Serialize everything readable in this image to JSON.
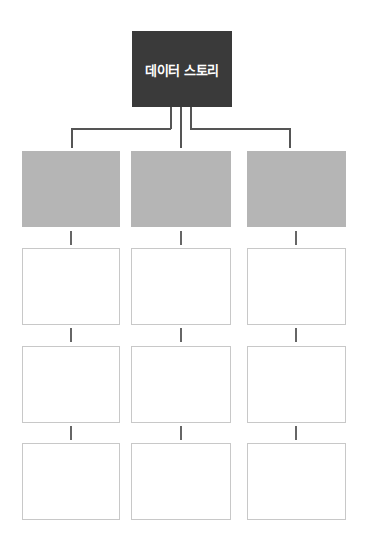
{
  "diagram": {
    "root": {
      "label": "데이터 스토리",
      "color": "#3a3a3a"
    },
    "columns": [
      {
        "header_color": "#b5b5b5",
        "cells": [
          "",
          "",
          ""
        ]
      },
      {
        "header_color": "#b5b5b5",
        "cells": [
          "",
          "",
          ""
        ]
      },
      {
        "header_color": "#b5b5b5",
        "cells": [
          "",
          "",
          ""
        ]
      }
    ]
  }
}
